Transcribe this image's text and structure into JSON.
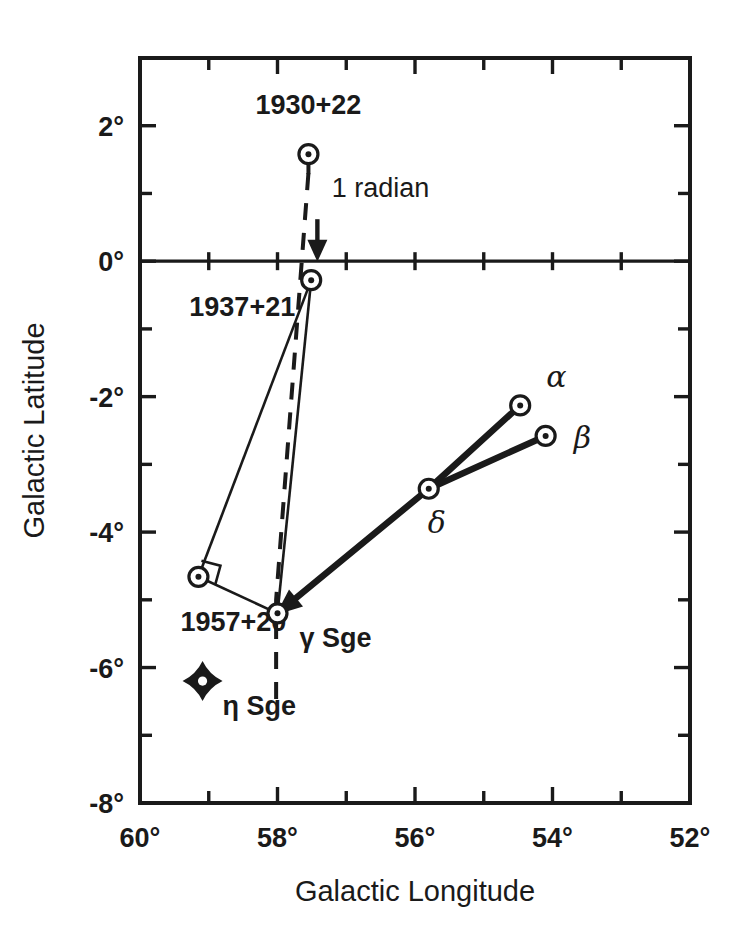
{
  "chart_data": {
    "type": "scatter",
    "title": "",
    "subtitle": "",
    "xlabel": "Galactic Longitude",
    "ylabel": "Galactic Latitude",
    "xlim": [
      60,
      52
    ],
    "ylim": [
      -8,
      3
    ],
    "x_axis_inverted": true,
    "grid": false,
    "legend": "none",
    "x_ticks_major": [
      "60°",
      "58°",
      "56°",
      "54°",
      "52°"
    ],
    "x_tick_values_major": [
      60,
      58,
      56,
      54,
      52
    ],
    "x_tick_values_minor": [
      59,
      57,
      55,
      53
    ],
    "y_ticks_major": [
      "2°",
      "0°",
      "-2°",
      "-4°",
      "-6°",
      "-8°"
    ],
    "y_tick_values_major": [
      2,
      0,
      -2,
      -4,
      -6,
      -8
    ],
    "y_tick_values_minor": [
      1,
      -1,
      -3,
      -5,
      -7
    ],
    "points": [
      {
        "label": "1930+22",
        "marker": "circle-dot-pin",
        "x": 57.55,
        "y": 1.58,
        "label_dx": 0,
        "label_dy": -40,
        "label_anchor": "middle"
      },
      {
        "label": "1937+21",
        "marker": "circle-dot",
        "x": 57.51,
        "y": -0.28,
        "label_dx": -16,
        "label_dy": 36,
        "label_anchor": "end"
      },
      {
        "label": "1957+20",
        "marker": "circle-dot",
        "x": 59.15,
        "y": -4.66,
        "label_dx": -18,
        "label_dy": 54,
        "label_anchor": "start"
      },
      {
        "label": "γ Sge",
        "marker": "circle-dot",
        "x": 58.0,
        "y": -5.2,
        "label_dx": 22,
        "label_dy": 34,
        "label_anchor": "start"
      },
      {
        "label": "δ",
        "marker": "circle-dot",
        "x": 55.8,
        "y": -3.36,
        "label_dx": 8,
        "label_dy": 44,
        "label_anchor": "middle"
      },
      {
        "label": "α",
        "marker": "circle-dot",
        "x": 54.47,
        "y": -2.13,
        "label_dx": 26,
        "label_dy": -18,
        "label_anchor": "start"
      },
      {
        "label": "β",
        "marker": "circle-dot",
        "x": 54.1,
        "y": -2.58,
        "label_dx": 28,
        "label_dy": 12,
        "label_anchor": "start"
      },
      {
        "label": "η Sge",
        "marker": "four-point-star",
        "x": 59.09,
        "y": -6.2,
        "label_dx": 20,
        "label_dy": 34,
        "label_anchor": "start"
      }
    ],
    "thin_links": [
      [
        "1937+21",
        "1957+20"
      ],
      [
        "1957+20",
        "γ Sge"
      ],
      [
        "γ Sge",
        "1937+21"
      ]
    ],
    "thick_links": [
      [
        "γ Sge",
        "δ"
      ],
      [
        "δ",
        "α"
      ],
      [
        "δ",
        "β"
      ]
    ],
    "dashed_path": [
      [
        57.55,
        1.3
      ],
      [
        58.02,
        -5.0
      ],
      [
        58.02,
        -6.65
      ]
    ],
    "annotations": [
      {
        "text": "1 radian",
        "x": 57.3,
        "y": 0.95,
        "arrow_from": [
          57.42,
          0.62
        ],
        "arrow_to": [
          57.42,
          0.05
        ]
      }
    ]
  },
  "axis": {
    "x_title": "Galactic Longitude",
    "y_title": "Galactic Latitude"
  }
}
